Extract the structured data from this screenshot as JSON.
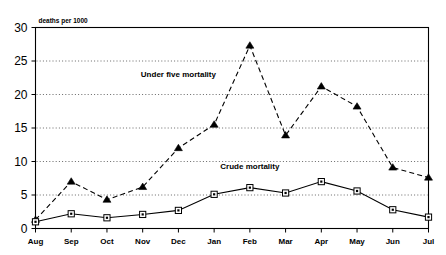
{
  "chart_data": {
    "type": "line",
    "title": "",
    "subtitle": "",
    "xlabel": "",
    "ylabel": "deaths per 1000",
    "ylim": [
      0,
      30
    ],
    "yticks": [
      0,
      5,
      10,
      15,
      20,
      25,
      30
    ],
    "grid": "horizontal-dotted",
    "legend_position": "inline-annotations",
    "categories": [
      "Aug",
      "Sep",
      "Oct",
      "Nov",
      "Dec",
      "Jan",
      "Feb",
      "Mar",
      "Apr",
      "May",
      "Jun",
      "Jul"
    ],
    "series": [
      {
        "name": "Under five mortality",
        "marker": "filled-triangle",
        "line_style": "dashed",
        "color": "#000000",
        "values": [
          1.3,
          7.0,
          4.3,
          6.2,
          12.0,
          15.5,
          27.3,
          13.9,
          21.2,
          18.2,
          9.1,
          7.6
        ]
      },
      {
        "name": "Crude mortality",
        "marker": "open-square",
        "line_style": "solid",
        "color": "#000000",
        "values": [
          1.0,
          2.2,
          1.6,
          2.1,
          2.7,
          5.1,
          6.1,
          5.3,
          7.0,
          5.6,
          2.8,
          1.7
        ]
      }
    ],
    "annotations": [
      {
        "text": "Under five mortality",
        "x_category": "Dec",
        "y_value": 22.6
      },
      {
        "text": "Crude mortality",
        "x_category": "Feb",
        "y_value": 8.9
      }
    ]
  }
}
